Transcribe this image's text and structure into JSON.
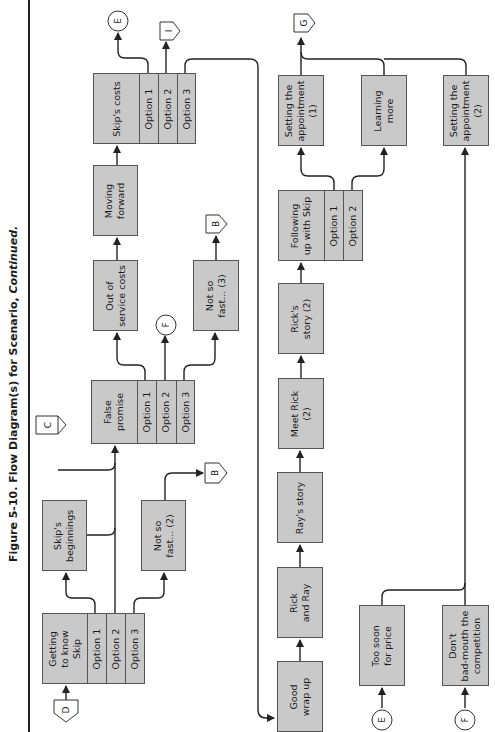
{
  "figure": {
    "title_prefix": "Figure 5-10.  Flow Diagram(s) for Scenario, ",
    "title_suffix": "Continued."
  },
  "nodes": {
    "getting_to_know_skip": {
      "label": "Getting\nto know\nSkip",
      "options": [
        "Option 1",
        "Option 2",
        "Option 3"
      ]
    },
    "skips_beginnings": {
      "label": "Skip's\nbeginnings"
    },
    "not_so_fast_2": {
      "label": "Not so\nfast... (2)"
    },
    "false_promise": {
      "label": "False\npromise",
      "options": [
        "Option 1",
        "Option 2",
        "Option 3"
      ]
    },
    "out_of_service_costs": {
      "label": "Out of\nservice costs"
    },
    "not_so_fast_3": {
      "label": "Not so\nfast... (3)"
    },
    "moving_forward": {
      "label": "Moving\nforward"
    },
    "skips_costs": {
      "label": "Skip's costs",
      "options": [
        "Option 1",
        "Option 2",
        "Option 3"
      ]
    },
    "good_wrap_up": {
      "label": "Good\nwrap up"
    },
    "rick_and_ray": {
      "label": "Rick\nand Ray"
    },
    "rays_story": {
      "label": "Ray's story"
    },
    "meet_rick_2": {
      "label": "Meet Rick\n(2)"
    },
    "ricks_story_2": {
      "label": "Rick's\nstory (2)"
    },
    "following_up_with_skip": {
      "label": "Following\nup with Skip",
      "options": [
        "Option 1",
        "Option 2"
      ]
    },
    "setting_appointment_1": {
      "label": "Setting the\nappointment\n(1)"
    },
    "learning_more": {
      "label": "Learning\nmore"
    },
    "setting_appointment_2": {
      "label": "Setting the\nappointment\n(2)"
    },
    "too_soon_for_price": {
      "label": "Too soon\nfor price"
    },
    "dont_bad_mouth": {
      "label": "Don't\nbad-mouth the\ncompetition"
    }
  },
  "connectors": {
    "d_in": "D",
    "c_in": "C",
    "b_out_1": "B",
    "f_out": "F",
    "b_out_2": "B",
    "e_out": "E",
    "i_out": "I",
    "g_out": "G",
    "e_in": "E",
    "f_in": "F"
  },
  "colors": {
    "box_fill": "#c9c9c9",
    "box_border": "#555555",
    "line": "#222222"
  }
}
